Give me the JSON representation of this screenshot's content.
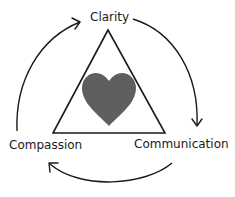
{
  "diagram": {
    "labels": {
      "top": "Clarity",
      "left": "Compassion",
      "right": "Communication"
    },
    "center_icon": "heart-icon",
    "colors": {
      "heart": "#5e5e5e",
      "stroke": "#1a1a1a",
      "text": "#1a1a1a",
      "background": "#ffffff"
    },
    "cycle_order": [
      "Clarity",
      "Communication",
      "Compassion"
    ]
  }
}
